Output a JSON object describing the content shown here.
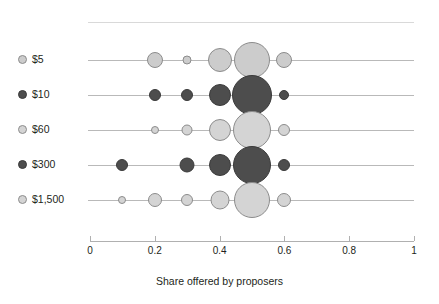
{
  "chart_data": {
    "type": "scatter",
    "title": "",
    "subtitle": "",
    "xlabel": "Share offered by proposers",
    "ylabel": "",
    "xlim": [
      0,
      1
    ],
    "xticks": [
      0,
      0.2,
      0.4,
      0.6,
      0.8,
      1
    ],
    "xticklabels": [
      "0",
      "0.2",
      "0.4",
      "0.6",
      "0.8",
      "1"
    ],
    "grid": false,
    "legend_position": "left-axis-labels",
    "size_encoding": "bubble area proportional to frequency of that offer share",
    "categories": [
      "$5",
      "$10",
      "$60",
      "$300",
      "$1,500"
    ],
    "series": [
      {
        "name": "$5",
        "fill": "#cccccc",
        "stroke": "#8c8c8c",
        "points": [
          {
            "x": 0.2,
            "size": 8
          },
          {
            "x": 0.3,
            "size": 4.5
          },
          {
            "x": 0.4,
            "size": 12
          },
          {
            "x": 0.5,
            "size": 18
          },
          {
            "x": 0.6,
            "size": 8
          }
        ]
      },
      {
        "name": "$10",
        "fill": "#4d4d4d",
        "stroke": "#3a3a3a",
        "points": [
          {
            "x": 0.2,
            "size": 6
          },
          {
            "x": 0.3,
            "size": 6
          },
          {
            "x": 0.4,
            "size": 11
          },
          {
            "x": 0.5,
            "size": 20
          },
          {
            "x": 0.6,
            "size": 5
          }
        ]
      },
      {
        "name": "$60",
        "fill": "#d4d4d4",
        "stroke": "#8c8c8c",
        "points": [
          {
            "x": 0.2,
            "size": 4
          },
          {
            "x": 0.3,
            "size": 5.5
          },
          {
            "x": 0.4,
            "size": 11
          },
          {
            "x": 0.5,
            "size": 19
          },
          {
            "x": 0.6,
            "size": 6
          }
        ]
      },
      {
        "name": "$300",
        "fill": "#4d4d4d",
        "stroke": "#3a3a3a",
        "points": [
          {
            "x": 0.1,
            "size": 6
          },
          {
            "x": 0.3,
            "size": 7.5
          },
          {
            "x": 0.4,
            "size": 11
          },
          {
            "x": 0.5,
            "size": 19
          },
          {
            "x": 0.6,
            "size": 6
          }
        ]
      },
      {
        "name": "$1,500",
        "fill": "#d4d4d4",
        "stroke": "#8c8c8c",
        "points": [
          {
            "x": 0.1,
            "size": 4
          },
          {
            "x": 0.2,
            "size": 7
          },
          {
            "x": 0.3,
            "size": 6
          },
          {
            "x": 0.4,
            "size": 9.5
          },
          {
            "x": 0.5,
            "size": 18
          },
          {
            "x": 0.6,
            "size": 7
          }
        ]
      }
    ]
  },
  "rows": [
    {
      "label": "$5"
    },
    {
      "label": "$10"
    },
    {
      "label": "$60"
    },
    {
      "label": "$300"
    },
    {
      "label": "$1,500"
    }
  ],
  "axis": {
    "title": "Share offered by proposers",
    "ticklabels": [
      "0",
      "0.2",
      "0.4",
      "0.6",
      "0.8",
      "1"
    ]
  },
  "colors": {
    "light_fill": "#d4d4d4",
    "light_stroke": "#8c8c8c",
    "dark_fill": "#4d4d4d",
    "dark_stroke": "#3a3a3a",
    "row_line": "#b9b9b9",
    "axis": "#b0b0b0",
    "text": "#231f20"
  }
}
